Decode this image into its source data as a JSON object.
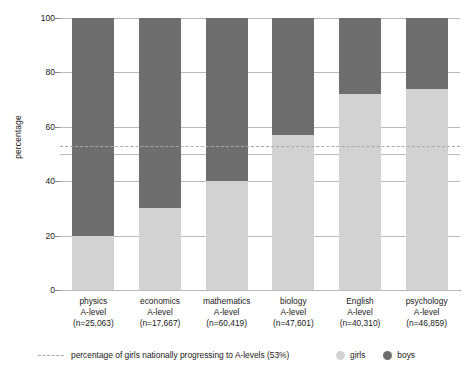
{
  "chart_data": {
    "type": "bar",
    "stacked": true,
    "title": "",
    "xlabel": "",
    "ylabel": "percentage",
    "ylim": [
      0,
      100
    ],
    "yticks": [
      0,
      20,
      40,
      60,
      80,
      100
    ],
    "gridlines": [
      0,
      20,
      40,
      50,
      60,
      80,
      100
    ],
    "grid": true,
    "legend_position": "bottom-right",
    "categories": [
      "physics\nA-level\n(n=25,063)",
      "economics\nA-level\n(n=17,667)",
      "mathematics\nA-level\n(n=60,419)",
      "biology\nA-level\n(n=47,601)",
      "English\nA-level\n(n=40,310)",
      "psychology\nA-level\n(n=46,859)"
    ],
    "category_details": [
      {
        "subject": "physics",
        "qualification": "A-level",
        "n": "(n=25,063)"
      },
      {
        "subject": "economics",
        "qualification": "A-level",
        "n": "(n=17,667)"
      },
      {
        "subject": "mathematics",
        "qualification": "A-level",
        "n": "(n=60,419)"
      },
      {
        "subject": "biology",
        "qualification": "A-level",
        "n": "(n=47,601)"
      },
      {
        "subject": "English",
        "qualification": "A-level",
        "n": "(n=40,310)"
      },
      {
        "subject": "psychology",
        "qualification": "A-level",
        "n": "(n=46,859)"
      }
    ],
    "series": [
      {
        "name": "girls",
        "color": "#d2d2d2",
        "values": [
          20,
          30,
          40,
          57,
          72,
          74
        ]
      },
      {
        "name": "boys",
        "color": "#6e6e6e",
        "values": [
          80,
          70,
          60,
          43,
          28,
          26
        ]
      }
    ],
    "reference_line": {
      "value": 53,
      "style": "dashed",
      "color": "#a8a8a8",
      "label": "percentage of girls nationally progressing to A-levels (53%)"
    }
  },
  "legend": {
    "reference_label": "percentage of girls nationally progressing to A-levels (53%)",
    "series": [
      {
        "label": "girls",
        "color": "#d2d2d2"
      },
      {
        "label": "boys",
        "color": "#6e6e6e"
      }
    ]
  },
  "axis": {
    "y_title": "percentage",
    "y_tick_labels": [
      "0",
      "20",
      "40",
      "60",
      "80",
      "100"
    ]
  }
}
